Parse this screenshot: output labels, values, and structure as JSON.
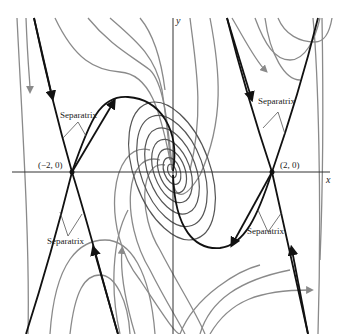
{
  "diagram": {
    "type": "phase-portrait",
    "axes": {
      "x_label": "x",
      "y_label": "y"
    },
    "equilibria": [
      {
        "label": "(−2, 0)",
        "kind": "saddle"
      },
      {
        "label": "(2, 0)",
        "kind": "saddle"
      },
      {
        "label": "",
        "kind": "spiral",
        "at": "origin"
      }
    ],
    "annotations": [
      {
        "text": "Separatrix",
        "position": "upper-left"
      },
      {
        "text": "Separatrix",
        "position": "upper-right"
      },
      {
        "text": "Separatrix",
        "position": "lower-left"
      },
      {
        "text": "Separatrix",
        "position": "lower-right"
      }
    ],
    "colors": {
      "separatrix": "#111111",
      "trajectory": "#8a8a8a",
      "axis": "#333333"
    }
  }
}
